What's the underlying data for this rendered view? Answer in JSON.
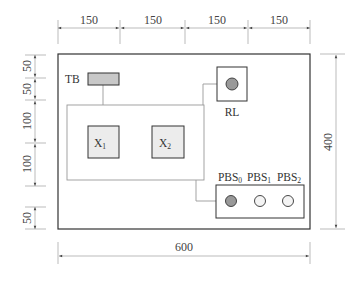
{
  "dimensions": {
    "top": [
      "150",
      "150",
      "150",
      "150"
    ],
    "left": [
      "50",
      "50",
      "100",
      "100",
      "50"
    ],
    "right": "400",
    "bottom": "600"
  },
  "components": {
    "tb": {
      "label": "TB"
    },
    "x1": {
      "label": "X",
      "sub": "1"
    },
    "x2": {
      "label": "X",
      "sub": "2"
    },
    "rl": {
      "label": "RL"
    },
    "pbs": [
      {
        "label": "PBS",
        "sub": "0",
        "state": "filled"
      },
      {
        "label": "PBS",
        "sub": "1",
        "state": "empty"
      },
      {
        "label": "PBS",
        "sub": "2",
        "state": "empty"
      }
    ]
  },
  "colors": {
    "outline": "#333333",
    "dim_line": "#aaaaaa",
    "fill_gray": "#c8c8c8",
    "fill_light": "#ececec",
    "indicator_filled": "#999999",
    "wire": "#999999"
  }
}
